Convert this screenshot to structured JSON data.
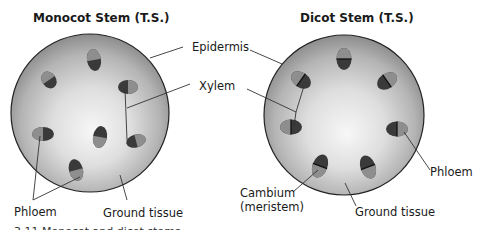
{
  "figure": {
    "monocot": {
      "title": "Monocot Stem (T.S.)",
      "labels": {
        "phloem": "Phloem",
        "ground_tissue": "Ground tissue"
      }
    },
    "dicot": {
      "title": "Dicot Stem (T.S.)",
      "labels": {
        "cambium_line1": "Cambium",
        "cambium_line2": "(meristem)",
        "phloem": "Phloem",
        "ground_tissue": "Ground tissue"
      }
    },
    "shared_labels": {
      "epidermis": "Epidermis",
      "xylem": "Xylem"
    },
    "caption_partial": "3.11 Monocot and dicot stems",
    "colors": {
      "sphere_light": "#f4f4f4",
      "sphere_mid": "#c8c8c8",
      "sphere_dark": "#8a8a8a",
      "xylem": "#3a3a3a",
      "phloem": "#8e8e8e",
      "cambium": "#111111",
      "outline": "#222222"
    }
  }
}
